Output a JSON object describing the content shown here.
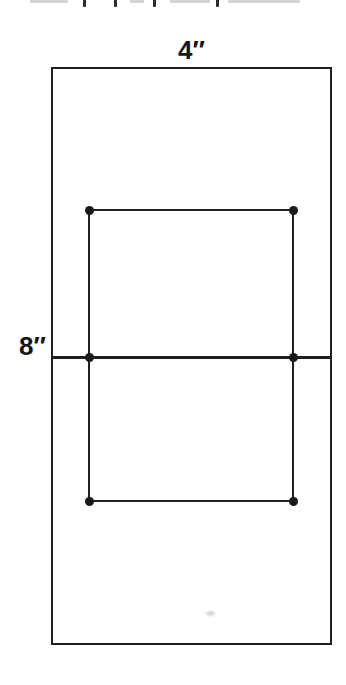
{
  "page": {
    "background": "#ffffff",
    "ink_color": "#202020",
    "label_color": "#161616"
  },
  "cropped_text_line": {
    "descender_marks_x": [
      83,
      114,
      153,
      216
    ],
    "smudges": [
      [
        30,
        38
      ],
      [
        130,
        14
      ],
      [
        170,
        40
      ],
      [
        228,
        72
      ]
    ]
  },
  "diagram": {
    "outer_rectangle": {
      "width_label": "4″",
      "height_label": "8″"
    },
    "dots": [
      {
        "x": 89,
        "y": 210
      },
      {
        "x": 293,
        "y": 210
      },
      {
        "x": 89,
        "y": 357
      },
      {
        "x": 293,
        "y": 357
      },
      {
        "x": 89,
        "y": 501
      },
      {
        "x": 293,
        "y": 501
      }
    ]
  }
}
